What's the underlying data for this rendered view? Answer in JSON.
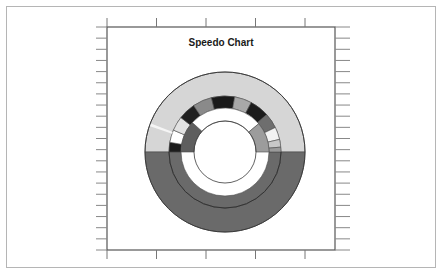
{
  "chart_data": {
    "type": "speedo",
    "title": "Speedo Chart",
    "xlabel": "",
    "ylabel": "",
    "grid": false,
    "legend": null,
    "axes": {
      "top_ticks": 5,
      "bottom_ticks": 5,
      "left_ticks": 20,
      "right_ticks": 20,
      "tick_labels": []
    },
    "gauge": {
      "center": [
        225,
        152
      ],
      "rings": [
        {
          "name": "outer-ring",
          "r_inner": 56,
          "r_outer": 80,
          "segments": [
            {
              "start_deg": 180,
              "end_deg": 360,
              "color": "#d6d6d6"
            },
            {
              "start_deg": 0,
              "end_deg": 180,
              "color": "#6a6a6a"
            }
          ]
        },
        {
          "name": "middle-ring",
          "r_inner": 44,
          "r_outer": 56,
          "segments": [
            {
              "start_deg": 0,
              "end_deg": 180,
              "color": "#6a6a6a"
            },
            {
              "start_deg": 180,
              "end_deg": 190,
              "color": "#1c1c1c"
            },
            {
              "start_deg": 190,
              "end_deg": 203,
              "color": "#ffffff"
            },
            {
              "start_deg": 203,
              "end_deg": 218,
              "color": "#e2e2e2"
            },
            {
              "start_deg": 218,
              "end_deg": 236,
              "color": "#202020"
            },
            {
              "start_deg": 236,
              "end_deg": 256,
              "color": "#8a8a8a"
            },
            {
              "start_deg": 256,
              "end_deg": 280,
              "color": "#1a1a1a"
            },
            {
              "start_deg": 280,
              "end_deg": 298,
              "color": "#a8a8a8"
            },
            {
              "start_deg": 298,
              "end_deg": 318,
              "color": "#1c1c1c"
            },
            {
              "start_deg": 318,
              "end_deg": 334,
              "color": "#6e6e6e"
            },
            {
              "start_deg": 334,
              "end_deg": 347,
              "color": "#f2f2f2"
            },
            {
              "start_deg": 347,
              "end_deg": 355,
              "color": "#c8c8c8"
            },
            {
              "start_deg": 355,
              "end_deg": 360,
              "color": "#9a9a9a"
            }
          ]
        },
        {
          "name": "inner-ring",
          "r_inner": 31,
          "r_outer": 44,
          "segments": [
            {
              "start_deg": 180,
              "end_deg": 222,
              "color": "#5e5e5e"
            },
            {
              "start_deg": 222,
              "end_deg": 320,
              "color": "#ffffff"
            },
            {
              "start_deg": 320,
              "end_deg": 360,
              "color": "#9c9c9c"
            }
          ]
        }
      ],
      "white_gap": {
        "start_deg": 200,
        "end_deg": 212,
        "r_inner": 56,
        "r_outer": 80
      }
    }
  }
}
